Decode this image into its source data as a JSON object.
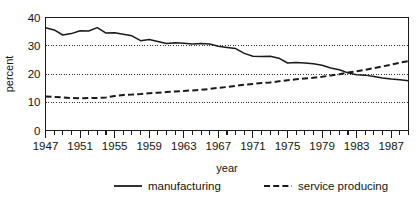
{
  "chart_data": {
    "type": "line",
    "title": "",
    "xlabel": "year",
    "ylabel": "percent",
    "xlim": [
      1947,
      1989
    ],
    "ylim": [
      0,
      40
    ],
    "yticks": [
      0,
      10,
      20,
      30,
      40
    ],
    "ytick_labels": [
      "0",
      "10",
      "20",
      "30",
      "40"
    ],
    "xticks": [
      1947,
      1948,
      1949,
      1950,
      1951,
      1952,
      1953,
      1954,
      1955,
      1956,
      1957,
      1958,
      1959,
      1960,
      1961,
      1962,
      1963,
      1964,
      1965,
      1966,
      1967,
      1968,
      1969,
      1970,
      1971,
      1972,
      1973,
      1974,
      1975,
      1976,
      1977,
      1978,
      1979,
      1980,
      1981,
      1982,
      1983,
      1984,
      1985,
      1986,
      1987,
      1988,
      1989
    ],
    "xtick_labels": [
      "1947",
      "1951",
      "1955",
      "1959",
      "1963",
      "1967",
      "1971",
      "1975",
      "1979",
      "1983",
      "1987"
    ],
    "labeled_xticks": [
      1947,
      1951,
      1955,
      1959,
      1963,
      1967,
      1971,
      1975,
      1979,
      1983,
      1987
    ],
    "grid": "horizontal-dotted",
    "gridlines": [
      10,
      20,
      30
    ],
    "legend_position": "bottom",
    "x": [
      1947,
      1948,
      1949,
      1950,
      1951,
      1952,
      1953,
      1954,
      1955,
      1956,
      1957,
      1958,
      1959,
      1960,
      1961,
      1962,
      1963,
      1964,
      1965,
      1966,
      1967,
      1968,
      1969,
      1970,
      1971,
      1972,
      1973,
      1974,
      1975,
      1976,
      1977,
      1978,
      1979,
      1980,
      1981,
      1982,
      1983,
      1984,
      1985,
      1986,
      1987,
      1988,
      1989
    ],
    "series": [
      {
        "name": "manufacturing",
        "style": "solid",
        "color": "#1a1a1a",
        "values": [
          36.4,
          35.6,
          33.8,
          34.3,
          35.3,
          35.2,
          36.4,
          34.5,
          34.6,
          34.1,
          33.5,
          31.8,
          32.2,
          31.5,
          30.8,
          31.1,
          30.9,
          30.6,
          30.8,
          30.6,
          29.8,
          29.4,
          29.0,
          27.3,
          26.3,
          26.2,
          26.3,
          25.6,
          23.9,
          24.1,
          23.9,
          23.6,
          23.1,
          22.1,
          21.5,
          20.4,
          19.7,
          19.6,
          19.1,
          18.6,
          18.2,
          18.0,
          17.6
        ]
      },
      {
        "name": "service producing",
        "style": "dashed",
        "color": "#1a1a1a",
        "values": [
          12.0,
          11.9,
          11.7,
          11.5,
          11.4,
          11.5,
          11.5,
          11.7,
          12.2,
          12.6,
          12.7,
          12.9,
          13.2,
          13.4,
          13.6,
          13.8,
          14.0,
          14.2,
          14.4,
          14.7,
          15.1,
          15.4,
          15.8,
          16.2,
          16.5,
          16.8,
          17.0,
          17.4,
          17.8,
          18.1,
          18.4,
          18.7,
          19.0,
          19.5,
          19.9,
          20.5,
          21.0,
          21.5,
          22.1,
          22.7,
          23.3,
          24.0,
          24.6
        ]
      }
    ]
  }
}
